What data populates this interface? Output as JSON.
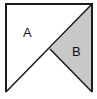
{
  "diagram": {
    "type": "geometry",
    "regions": [
      {
        "label": "A",
        "shaded": false
      },
      {
        "label": "B",
        "shaded": true
      }
    ],
    "colors": {
      "stroke": "#1a1a1a",
      "shade": "#c8c8c8",
      "background": "#ffffff"
    }
  }
}
